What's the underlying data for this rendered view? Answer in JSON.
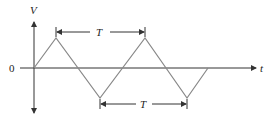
{
  "diagram": {
    "type": "triangle-wave",
    "labels": {
      "y_axis": "V",
      "x_axis": "t",
      "origin": "0",
      "period_top": "T",
      "period_bottom": "T"
    },
    "colors": {
      "axis": "#333333",
      "wave": "#888888",
      "text": "#222222"
    },
    "waveform_points": [
      [
        34,
        68
      ],
      [
        56,
        38
      ],
      [
        100,
        98
      ],
      [
        145,
        38
      ],
      [
        187,
        98
      ],
      [
        208,
        68
      ]
    ]
  }
}
